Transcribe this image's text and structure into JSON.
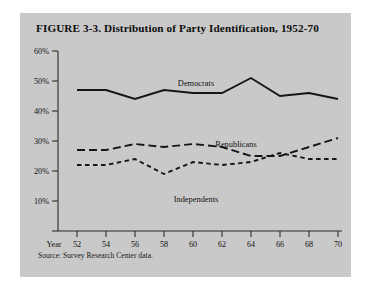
{
  "figure": {
    "title": "FIGURE  3-3.  Distribution of Party Identification, 1952-70",
    "source": "Source:  Survey Research Center data.",
    "background_color": "#c9c9c9",
    "line_color": "#161616",
    "page_color": "#ffffff"
  },
  "axes": {
    "x_axis_label": "Year",
    "x_tick_labels": [
      "52",
      "54",
      "56",
      "58",
      "60",
      "62",
      "64",
      "66",
      "68",
      "70"
    ],
    "y_tick_labels": [
      "10%",
      "20%",
      "30%",
      "40%",
      "50%",
      "60%"
    ]
  },
  "chart_data": {
    "type": "line",
    "title": "FIGURE  3-3.  Distribution of Party Identification, 1952-70",
    "subtitle": "",
    "xlabel": "Year",
    "ylabel": "",
    "x": [
      1952,
      1954,
      1956,
      1958,
      1960,
      1962,
      1964,
      1966,
      1968,
      1970
    ],
    "categories": [
      "52",
      "54",
      "56",
      "58",
      "60",
      "62",
      "64",
      "66",
      "68",
      "70"
    ],
    "xlim": [
      1952,
      1970
    ],
    "ylim": [
      0,
      60
    ],
    "y_ticks": [
      10,
      20,
      30,
      40,
      50,
      60
    ],
    "y_tick_format": "percent",
    "grid": false,
    "legend": "inline-labels",
    "annotations": [
      "Democrats",
      "Republicans",
      "Independents"
    ],
    "series": [
      {
        "name": "Democrats",
        "style": "solid",
        "values": [
          47,
          47,
          44,
          47,
          46,
          46,
          51,
          45,
          46,
          44
        ]
      },
      {
        "name": "Republicans",
        "style": "long-dash",
        "values": [
          27,
          27,
          29,
          28,
          29,
          28,
          25,
          25,
          28,
          31
        ]
      },
      {
        "name": "Independents",
        "style": "short-dash",
        "values": [
          22,
          22,
          24,
          19,
          23,
          22,
          23,
          26,
          24,
          24
        ]
      }
    ],
    "source": "Source:  Survey Research Center data."
  }
}
